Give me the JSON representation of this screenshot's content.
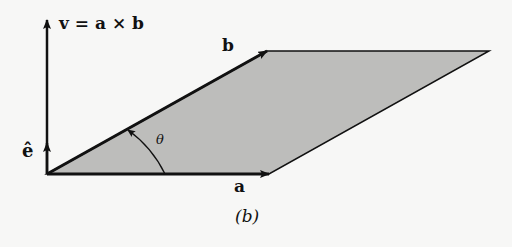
{
  "figure": {
    "caption": "(b)",
    "colors": {
      "background": "#f7f7f6",
      "parallelogram_fill": "#bdbdbb",
      "stroke": "#111111"
    },
    "labels": {
      "v_equation": "v = a × b",
      "b": "b",
      "a": "a",
      "e_hat": "ê",
      "theta": "θ"
    },
    "geometry": {
      "origin": [
        47,
        174
      ],
      "a_tip": [
        269,
        174
      ],
      "b_tip": [
        267,
        51
      ],
      "far_corner": [
        489,
        51
      ],
      "v_tip": [
        47,
        20
      ],
      "e_hat_tip": [
        47,
        143
      ]
    }
  }
}
